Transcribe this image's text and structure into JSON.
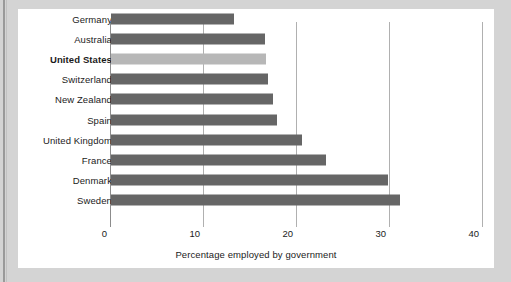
{
  "figure": {
    "axis_title": "Percentage employed by government",
    "background_color": "#d4d4d4",
    "panel_color": "#ffffff",
    "bar_color": "#666666",
    "highlight_bar_color": "#b7b7b7"
  },
  "chart_data": {
    "type": "bar",
    "orientation": "horizontal",
    "title": "",
    "subtitle": "",
    "xlabel": "Percentage employed by government",
    "ylabel": "",
    "xlim": [
      0,
      40
    ],
    "ylim": null,
    "grid": true,
    "legend": null,
    "xticks": [
      0,
      10,
      20,
      30,
      40
    ],
    "xtick_labels": [
      "0",
      "10",
      "20",
      "30",
      "40"
    ],
    "categories": [
      "Germany",
      "Australia",
      "United States",
      "Switzerland",
      "New Zealand",
      "Spain",
      "United Kingdom",
      "France",
      "Denmark",
      "Sweden"
    ],
    "values": [
      13.2,
      16.6,
      16.7,
      16.9,
      17.4,
      17.9,
      20.5,
      23.1,
      29.8,
      31.1
    ],
    "highlight_category": "United States",
    "highlight_index": 2,
    "series": [
      {
        "name": "Percentage employed by government",
        "values": [
          13.2,
          16.6,
          16.7,
          16.9,
          17.4,
          17.9,
          20.5,
          23.1,
          29.8,
          31.1
        ]
      }
    ]
  }
}
